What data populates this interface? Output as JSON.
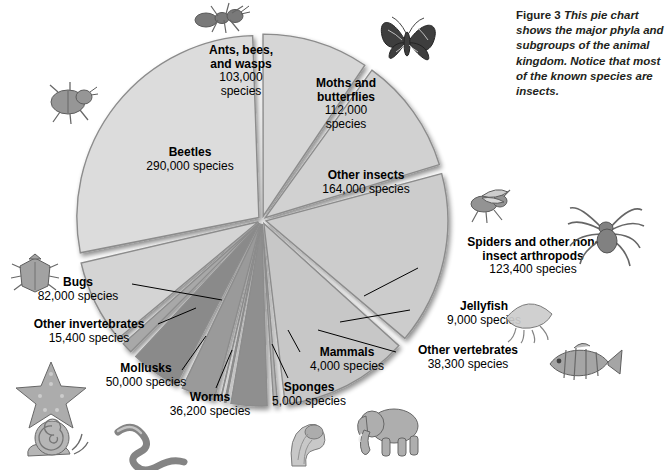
{
  "figure": {
    "label": "Figure 3",
    "caption": "This pie chart shows the major phyla and subgroups of the animal kingdom. Notice that most of the known species are insects."
  },
  "chart_data": {
    "type": "pie",
    "title": "Major phyla and subgroups of the animal kingdom",
    "unit": "species",
    "total_species": 1032300,
    "legend": "labels placed around slices with leader lines",
    "grid": false,
    "categories": [
      "Beetles",
      "Ants, bees, and wasps",
      "Moths and butterflies",
      "Other insects",
      "Spiders and other non-insect arthropods",
      "Jellyfish",
      "Other vertebrates",
      "Mammals",
      "Sponges",
      "Worms",
      "Mollusks",
      "Other invertebrates",
      "Bugs"
    ],
    "values": [
      290000,
      103000,
      112000,
      164000,
      123400,
      9000,
      38300,
      4000,
      5000,
      36200,
      50000,
      15400,
      82000
    ],
    "value_labels": [
      "290,000 species",
      "103,000 species",
      "112,000 species",
      "164,000 species",
      "123,400 species",
      "9,000 species",
      "38,300 species",
      "4,000 species",
      "5,000 species",
      "36,200 species",
      "50,000 species",
      "15,400 species",
      "82,000 species"
    ],
    "slices": [
      {
        "name": "Ants, bees, and wasps",
        "value": 103000,
        "value_label": "103,000",
        "unit_label": "species",
        "fill": "#d6d6d6"
      },
      {
        "name": "Moths and butterflies",
        "value": 112000,
        "value_label": "112,000",
        "unit_label": "species",
        "fill": "#d1d1d1"
      },
      {
        "name": "Other insects",
        "value": 164000,
        "value_label": "164,000 species",
        "fill": "#cccccc"
      },
      {
        "name": "Spiders and other non-insect arthropods",
        "value": 123400,
        "value_label": "123,400 species",
        "fill": "#c7c7c7"
      },
      {
        "name": "Jellyfish",
        "value": 9000,
        "value_label": "9,000 species",
        "fill": "#b3b3b3"
      },
      {
        "name": "Other vertebrates",
        "value": 38300,
        "value_label": "38,300 species",
        "fill": "#8f8f8f"
      },
      {
        "name": "Mammals",
        "value": 4000,
        "value_label": "4,000 species",
        "fill": "#6f6f6f"
      },
      {
        "name": "Sponges",
        "value": 5000,
        "value_label": "5,000 species",
        "fill": "#5c5c5c"
      },
      {
        "name": "Worms",
        "value": 36200,
        "value_label": "36,200 species",
        "fill": "#9a9a9a"
      },
      {
        "name": "Mollusks",
        "value": 50000,
        "value_label": "50,000 species",
        "fill": "#8a8a8a"
      },
      {
        "name": "Other invertebrates",
        "value": 15400,
        "value_label": "15,400 species",
        "fill": "#a8a8a8"
      },
      {
        "name": "Bugs",
        "value": 82000,
        "value_label": "82,000 species",
        "fill": "#d4d4d4"
      },
      {
        "name": "Beetles",
        "value": 290000,
        "value_label": "290,000 species",
        "fill": "#dcdcdc"
      }
    ]
  },
  "labels": {
    "ants": {
      "name": "Ants, bees,",
      "name2": "and wasps",
      "value": "103,000",
      "unit": "species"
    },
    "moths": {
      "name": "Moths and",
      "name2": "butterflies",
      "value": "112,000",
      "unit": "species"
    },
    "beetles": {
      "name": "Beetles",
      "value": "290,000 species"
    },
    "other_insects": {
      "name": "Other insects",
      "value": "164,000 species"
    },
    "spiders": {
      "name": "Spiders and other non-",
      "name2": "insect arthropods",
      "value": "123,400 species"
    },
    "jellyfish": {
      "name": "Jellyfish",
      "value": "9,000 species"
    },
    "other_vertebrates": {
      "name": "Other vertebrates",
      "value": "38,300 species"
    },
    "mammals": {
      "name": "Mammals",
      "value": "4,000 species"
    },
    "sponges": {
      "name": "Sponges",
      "value": "5,000 species"
    },
    "worms": {
      "name": "Worms",
      "value": "36,200 species"
    },
    "mollusks": {
      "name": "Mollusks",
      "value": "50,000 species"
    },
    "other_invertebrates": {
      "name": "Other invertebrates",
      "value": "15,400 species"
    },
    "bugs": {
      "name": "Bugs",
      "value": "82,000 species"
    }
  },
  "decorations": {
    "ant": "ant-illustration",
    "butterfly": "butterfly-illustration",
    "beetle": "beetle-illustration",
    "bug": "shield-bug-illustration",
    "fly": "fly-illustration",
    "spider": "spider-illustration",
    "jellyfish": "jellyfish-illustration",
    "fish": "fish-illustration",
    "elephant": "elephant-illustration",
    "sponge": "sponge-illustration",
    "worm": "worm-illustration",
    "snail": "snail-illustration",
    "starfish": "starfish-illustration"
  },
  "colors": {
    "slice_light": "#dcdcdc",
    "slice_mid": "#9a9a9a",
    "slice_dark": "#5c5c5c",
    "slice_edge": "#8c8c8c",
    "text": "#000000",
    "caption_text": "#231f20",
    "background": "#ffffff"
  }
}
